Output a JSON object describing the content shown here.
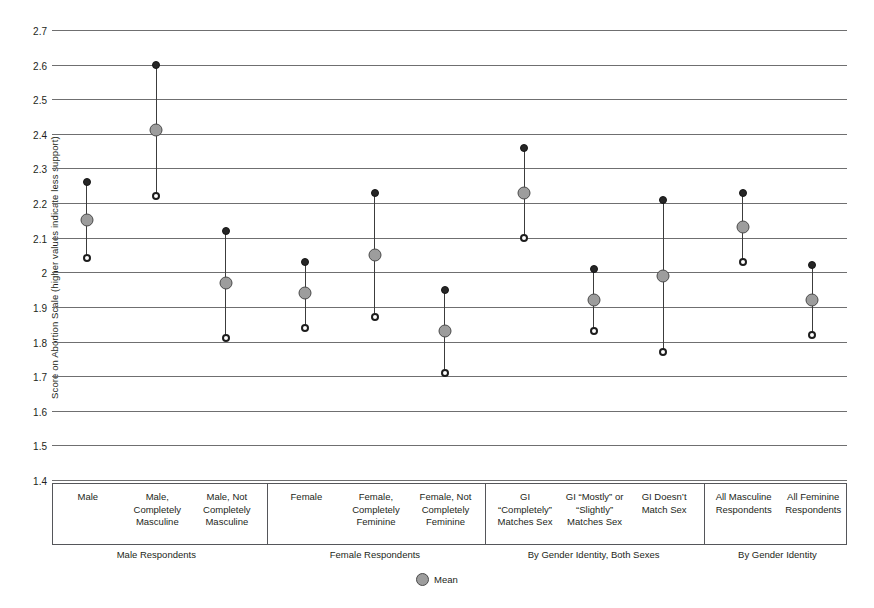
{
  "chart_data": {
    "type": "scatter",
    "title": "",
    "xlabel": "",
    "ylabel": "Score on Abortion Scale (higher values indicate less support)",
    "ylim": [
      1.4,
      2.7
    ],
    "ytick_labels": [
      "2.7",
      "2.6",
      "2.5",
      "2.4",
      "2.3",
      "2.2",
      "2.1",
      "2",
      "1.9",
      "1.8",
      "1.7",
      "1.6",
      "1.5",
      "1.4"
    ],
    "yticks": [
      2.7,
      2.6,
      2.5,
      2.4,
      2.3,
      2.2,
      2.1,
      2.0,
      1.9,
      1.8,
      1.7,
      1.6,
      1.5,
      1.4
    ],
    "grid": true,
    "legend_position": "bottom-center",
    "legend": [
      {
        "label": "Mean",
        "marker": "filled-gray-circle",
        "color": "#9d9d9d"
      }
    ],
    "marker_styles": {
      "upper": "filled-black-circle",
      "mean": "filled-gray-circle",
      "lower": "open-circle"
    },
    "categories": [
      "Male",
      "Male, Completely Masculine",
      "Male, Not Completely Masculine",
      "Female",
      "Female, Completely Feminine",
      "Female, Not Completely Feminine",
      "GI \"Completely\" Matches Sex",
      "GI \"Mostly\" or \"Slightly\" Matches Sex",
      "GI Doesn't Match Sex",
      "All Masculine Respondents",
      "All Feminine Respondents"
    ],
    "series": [
      {
        "name": "Upper bound",
        "values": [
          2.26,
          2.6,
          2.12,
          2.03,
          2.23,
          1.95,
          2.36,
          2.01,
          2.21,
          2.23,
          2.02
        ]
      },
      {
        "name": "Mean",
        "values": [
          2.15,
          2.41,
          1.97,
          1.94,
          2.05,
          1.83,
          2.23,
          1.92,
          1.99,
          2.13,
          1.92
        ]
      },
      {
        "name": "Lower bound",
        "values": [
          2.04,
          2.22,
          1.81,
          1.84,
          1.87,
          1.71,
          2.1,
          1.83,
          1.77,
          2.03,
          1.82
        ]
      }
    ],
    "groups": [
      {
        "label": "Male Respondents",
        "categories": [
          "Male",
          "Male, Completely Masculine",
          "Male, Not Completely Masculine"
        ]
      },
      {
        "label": "Female Respondents",
        "categories": [
          "Female",
          "Female, Completely Feminine",
          "Female, Not Completely Feminine"
        ]
      },
      {
        "label": "By Gender Identity, Both Sexes",
        "categories": [
          "GI \"Completely\" Matches Sex",
          "GI \"Mostly\" or \"Slightly\" Matches Sex",
          "GI Doesn't Match Sex"
        ]
      },
      {
        "label": "By Gender Identity",
        "categories": [
          "All Masculine Respondents",
          "All Feminine Respondents"
        ]
      }
    ]
  },
  "axis": {
    "y_title": "Score on Abortion Scale (higher values indicate less support)"
  },
  "category_labels": [
    "Male",
    "Male,\nCompletely\nMasculine",
    "Male, Not\nCompletely\nMasculine",
    "Female",
    "Female,\nCompletely\nFeminine",
    "Female, Not\nCompletely\nFeminine",
    "GI\n“Completely”\nMatches Sex",
    "GI “Mostly” or\n“Slightly”\nMatches Sex",
    "GI Doesn’t\nMatch Sex",
    "All Masculine\nRespondents",
    "All Feminine\nRespondents"
  ],
  "panel_labels": [
    "Male Respondents",
    "Female Respondents",
    "By Gender Identity, Both Sexes",
    "By Gender Identity"
  ],
  "legend": {
    "mean_label": "Mean"
  },
  "colors": {
    "mean_marker": "#9d9d9d",
    "bound_marker": "#262626",
    "gridline": "#6f6f70",
    "axis_box": "#55565a",
    "text": "#231f20"
  }
}
